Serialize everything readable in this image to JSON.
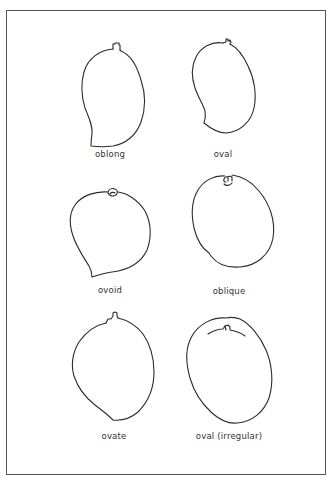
{
  "figure": {
    "type": "mango fruit shape classification",
    "shapes": [
      {
        "id": "oblong",
        "label": "oblong"
      },
      {
        "id": "oval",
        "label": "oval"
      },
      {
        "id": "ovoid",
        "label": "ovoid"
      },
      {
        "id": "oblique",
        "label": "oblique"
      },
      {
        "id": "ovate",
        "label": "ovate"
      },
      {
        "id": "oval-irregular",
        "label": "oval (irregular)"
      }
    ]
  },
  "style": {
    "stroke_color": "#2b2b2b",
    "frame_color": "#555555",
    "background": "#ffffff"
  }
}
